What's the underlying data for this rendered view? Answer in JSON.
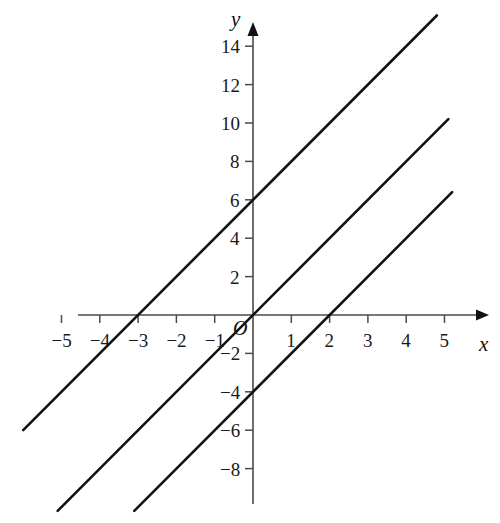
{
  "figure": {
    "kind": "cartesian-line-graph",
    "background_color": "#ffffff",
    "line_color": "#121212",
    "axis_color": "#4a4a4a",
    "text_color": "#1a1a1a"
  },
  "axes": {
    "x_label": "x",
    "y_label": "y",
    "origin_label": "O",
    "x_tick_labels": [
      "−5",
      "−4",
      "−3",
      "−2",
      "−1",
      "1",
      "2",
      "3",
      "4",
      "5"
    ],
    "x_tick_values": [
      -5,
      -4,
      -3,
      -2,
      -1,
      1,
      2,
      3,
      4,
      5
    ],
    "y_tick_labels": [
      "14",
      "12",
      "10",
      "8",
      "6",
      "4",
      "2",
      "−2",
      "−4",
      "−6",
      "−8"
    ],
    "y_tick_values": [
      14,
      12,
      10,
      8,
      6,
      4,
      2,
      -2,
      -4,
      -6,
      -8
    ],
    "x_range": [
      -6.6,
      5.9
    ],
    "y_range": [
      -10.5,
      16.4
    ],
    "grid": false
  },
  "chart_data": {
    "type": "line",
    "title": "",
    "xlabel": "x",
    "ylabel": "y",
    "xlim": [
      -6.6,
      5.9
    ],
    "ylim": [
      -10.5,
      16.4
    ],
    "grid": false,
    "legend": "none",
    "series": [
      {
        "name": "y = 2x + 6",
        "slope": 2,
        "intercept": 6,
        "x_intercept": -3,
        "y_intercept": 6,
        "x": [
          -6.0,
          4.8
        ],
        "y": [
          -6.0,
          15.6
        ]
      },
      {
        "name": "y = 2x",
        "slope": 2,
        "intercept": 0,
        "x_intercept": 0,
        "y_intercept": 0,
        "x": [
          -5.1,
          5.1
        ],
        "y": [
          -10.2,
          10.2
        ]
      },
      {
        "name": "y = 2x - 4",
        "slope": 2,
        "intercept": -4,
        "x_intercept": 2,
        "y_intercept": -4,
        "x": [
          -3.1,
          5.2
        ],
        "y": [
          -10.2,
          6.4
        ]
      }
    ]
  }
}
